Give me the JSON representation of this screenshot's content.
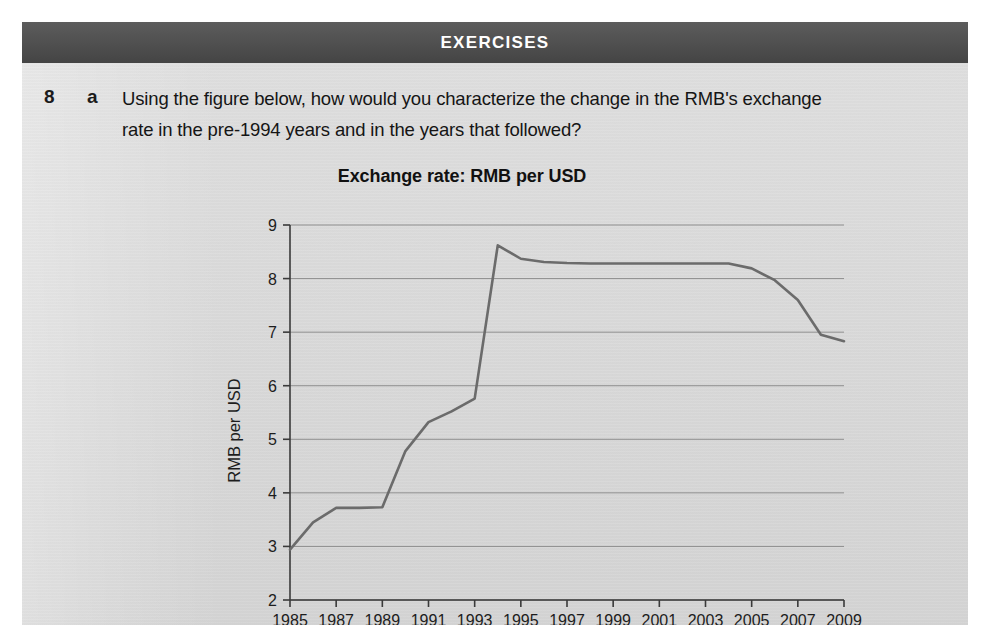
{
  "header": {
    "title": "EXERCISES",
    "bar_color": "#4c4c4c",
    "text_color": "#ffffff"
  },
  "question": {
    "number": "8",
    "letter": "a",
    "text": "Using the figure below, how would you characterize the change in the RMB's exchange rate in the pre-1994 years and in the years that followed?"
  },
  "page": {
    "background_color": "#dcdcdc",
    "margin_color": "#ffffff"
  },
  "chart_data": {
    "type": "line",
    "title": "Exchange rate: RMB per USD",
    "xlabel": "",
    "ylabel": "RMB per USD",
    "xlim": [
      1985,
      2009
    ],
    "ylim": [
      2,
      9
    ],
    "yticks": [
      2,
      3,
      4,
      5,
      6,
      7,
      8,
      9
    ],
    "xticks": [
      1985,
      1987,
      1989,
      1991,
      1993,
      1995,
      1997,
      1999,
      2001,
      2003,
      2005,
      2007,
      2009
    ],
    "xtick_labels": [
      "1985",
      "1987",
      "1989",
      "1991",
      "1993",
      "1995",
      "1997",
      "1999",
      "2001",
      "2003",
      "2005",
      "2007",
      "2009"
    ],
    "ytick_labels": [
      "2",
      "3",
      "4",
      "5",
      "6",
      "7",
      "8",
      "9"
    ],
    "grid": "horizontal",
    "legend": "none",
    "line_color": "#6b6b6b",
    "line_width": 2.6,
    "x": [
      1985,
      1986,
      1987,
      1988,
      1989,
      1990,
      1991,
      1992,
      1993,
      1994,
      1995,
      1996,
      1997,
      1998,
      1999,
      2000,
      2001,
      2002,
      2003,
      2004,
      2005,
      2006,
      2007,
      2008,
      2009
    ],
    "values": [
      2.94,
      3.45,
      3.72,
      3.72,
      3.73,
      4.78,
      5.32,
      5.52,
      5.76,
      8.62,
      8.37,
      8.31,
      8.29,
      8.28,
      8.28,
      8.28,
      8.28,
      8.28,
      8.28,
      8.28,
      8.19,
      7.97,
      7.6,
      6.95,
      6.83
    ],
    "series": [
      {
        "name": "RMB per USD",
        "values": [
          2.94,
          3.45,
          3.72,
          3.72,
          3.73,
          4.78,
          5.32,
          5.52,
          5.76,
          8.62,
          8.37,
          8.31,
          8.29,
          8.28,
          8.28,
          8.28,
          8.28,
          8.28,
          8.28,
          8.28,
          8.19,
          7.97,
          7.6,
          6.95,
          6.83
        ]
      }
    ]
  }
}
